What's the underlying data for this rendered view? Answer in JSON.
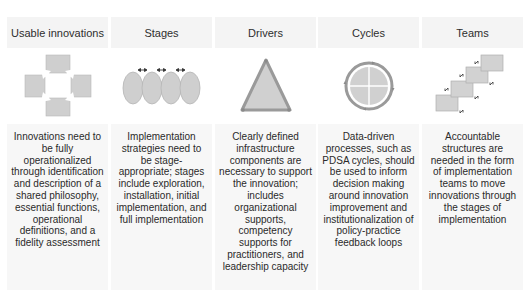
{
  "diagram": {
    "colors": {
      "panel_bg": "#f4f4f4",
      "shape_fill": "#cfcfcf",
      "shape_stroke": "#9a9a9a",
      "text": "#2a2a2a"
    },
    "columns": [
      {
        "title": "Usable innovations",
        "icon": "cross-arrows-squares-icon",
        "description": "Innovations need to be fully operationalized through identification and description of a shared philosophy, essential functions, operational definitions, and a fidelity assessment"
      },
      {
        "title": "Stages",
        "icon": "overlapping-ovals-icon",
        "description": "Implementation strategies need to be stage-appropriate; stages include exploration, installation, initial implementation, and full implementation"
      },
      {
        "title": "Drivers",
        "icon": "triangle-icon",
        "description": "Clearly defined infrastructure components are necessary to support the innovation; includes organizational supports, competency supports for practitioners, and leadership capacity"
      },
      {
        "title": "Cycles",
        "icon": "cycle-circle-icon",
        "description": "Data-driven processes, such as PDSA cycles, should be used to inform decision making around innovation improvement and institutionalization of policy-practice feedback loops"
      },
      {
        "title": "Teams",
        "icon": "staircase-boxes-icon",
        "description": "Accountable structures are needed in the form of implementation teams to move innovations through the stages of implementation"
      }
    ]
  }
}
